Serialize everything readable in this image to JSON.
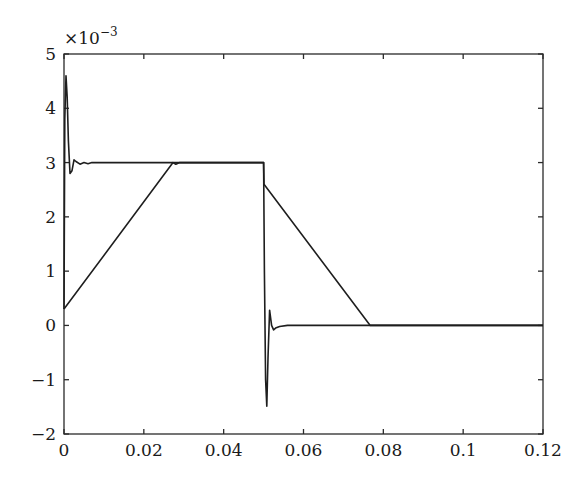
{
  "chart_data": {
    "type": "line",
    "title": "",
    "xlabel": "",
    "ylabel": "",
    "y_multiplier": "×10^-3",
    "y_multiplier_base": "×10",
    "y_multiplier_exp": "−3",
    "xlim": [
      0,
      0.12
    ],
    "ylim": [
      -2,
      5
    ],
    "grid": false,
    "legend": null,
    "x_ticks": [
      0,
      0.02,
      0.04,
      0.06,
      0.08,
      0.1,
      0.12
    ],
    "x_tick_labels": [
      "0",
      "0.02",
      "0.04",
      "0.06",
      "0.08",
      "0.1",
      "0.12"
    ],
    "y_ticks": [
      -2,
      -1,
      0,
      1,
      2,
      3,
      4,
      5
    ],
    "y_tick_labels": [
      "−2",
      "−1",
      "0",
      "1",
      "2",
      "3",
      "4",
      "5"
    ],
    "series": [
      {
        "name": "response",
        "x": [
          0,
          0.0002,
          0.0005,
          0.0008,
          0.0011,
          0.0015,
          0.002,
          0.0025,
          0.003,
          0.004,
          0.005,
          0.006,
          0.007,
          0.008,
          0.05,
          0.0502,
          0.0505,
          0.0508,
          0.0511,
          0.0515,
          0.052,
          0.0525,
          0.053,
          0.054,
          0.056,
          0.058,
          0.06,
          0.08,
          0.12
        ],
        "values": [
          0.3,
          3.8,
          4.6,
          4.2,
          3.4,
          2.8,
          2.85,
          3.05,
          3.02,
          2.97,
          3.0,
          2.98,
          3.0,
          3.0,
          3.0,
          1.0,
          -1.0,
          -1.49,
          -0.6,
          0.28,
          0.0,
          -0.08,
          -0.05,
          -0.02,
          0.0,
          0.0,
          0.0,
          0.0,
          0.0
        ]
      },
      {
        "name": "reference ramp",
        "x": [
          0,
          0.0273,
          0.028,
          0.029,
          0.05,
          0.0501,
          0.0767,
          0.08,
          0.12
        ],
        "values": [
          0.3,
          3.0,
          2.97,
          3.0,
          3.0,
          2.6,
          0.0,
          0.0,
          0.0
        ]
      }
    ]
  }
}
